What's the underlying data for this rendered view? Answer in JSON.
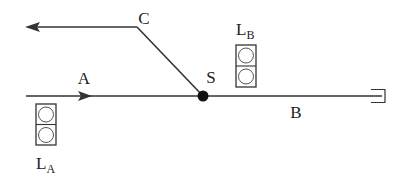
{
  "diagram": {
    "type": "railway-junction",
    "colors": {
      "line": "#333333",
      "node": "#111111",
      "background": "#ffffff"
    },
    "labels": {
      "A": "A",
      "B": "B",
      "C": "C",
      "S": "S",
      "LA_main": "L",
      "LA_sub": "A",
      "LB_main": "L",
      "LB_sub": "B"
    },
    "nodes": [
      {
        "id": "S",
        "label": "S",
        "type": "switch-point"
      }
    ],
    "tracks": [
      {
        "id": "A",
        "label": "A",
        "from": "left",
        "to": "S",
        "direction": "toward S"
      },
      {
        "id": "B",
        "label": "B",
        "from": "S",
        "to": "buffer-stop"
      },
      {
        "id": "C",
        "label": "C",
        "from": "S",
        "to": "left",
        "direction": "away from S"
      }
    ],
    "signals": [
      {
        "id": "LA",
        "label": "L_A",
        "lamps": 2,
        "position": "below track A"
      },
      {
        "id": "LB",
        "label": "L_B",
        "lamps": 2,
        "position": "above track B"
      }
    ]
  }
}
